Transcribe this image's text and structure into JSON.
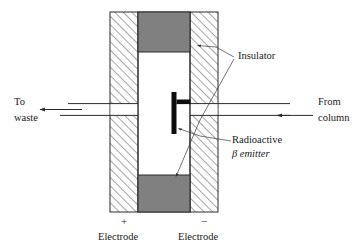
{
  "figure": {
    "colors": {
      "line": "#2b2b2b",
      "insulator_fill": "#808080",
      "emitter_fill": "#0d0d0d",
      "hatch": "#3a3a3a",
      "background": "#ffffff"
    },
    "labels": {
      "insulator": "Insulator",
      "radioactive": "Radioactive",
      "beta_emitter": "β emitter",
      "to_waste_line1": "To",
      "to_waste_line2": "waste",
      "from_column_line1": "From",
      "from_column_line2": "column",
      "electrode_left_sign": "+",
      "electrode_left": "Electrode",
      "electrode_right_sign": "−",
      "electrode_right": "Electrode"
    },
    "parts": {
      "electrode_left_name": "positive-electrode-block",
      "electrode_right_name": "negative-electrode-block",
      "insulator_top_name": "insulator-block-top",
      "insulator_bottom_name": "insulator-block-bottom",
      "emitter_name": "radioactive-beta-emitter",
      "channel_name": "flow-channel",
      "inlet_name": "inlet-tube-from-column",
      "outlet_name": "outlet-tube-to-waste"
    }
  }
}
